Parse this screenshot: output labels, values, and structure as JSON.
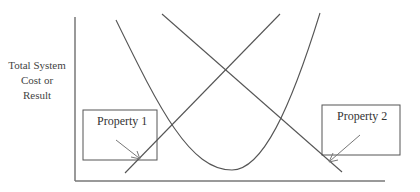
{
  "diagram": {
    "y_axis_label_lines": [
      "Total System",
      "Cost or",
      "Result"
    ],
    "x_axis_label": "",
    "curves": [
      {
        "name": "u-shaped-total-curve",
        "type": "parabola"
      },
      {
        "name": "rising-line",
        "type": "line"
      },
      {
        "name": "falling-line",
        "type": "line"
      }
    ],
    "callouts": [
      {
        "label": "Property 1",
        "points_to": "intersection of rising line near bottom-left"
      },
      {
        "label": "Property 2",
        "points_to": "falling line near bottom-right"
      }
    ],
    "colors": {
      "line": "#555555",
      "box": "#555555",
      "arrow": "#777777",
      "background": "#ffffff"
    }
  }
}
